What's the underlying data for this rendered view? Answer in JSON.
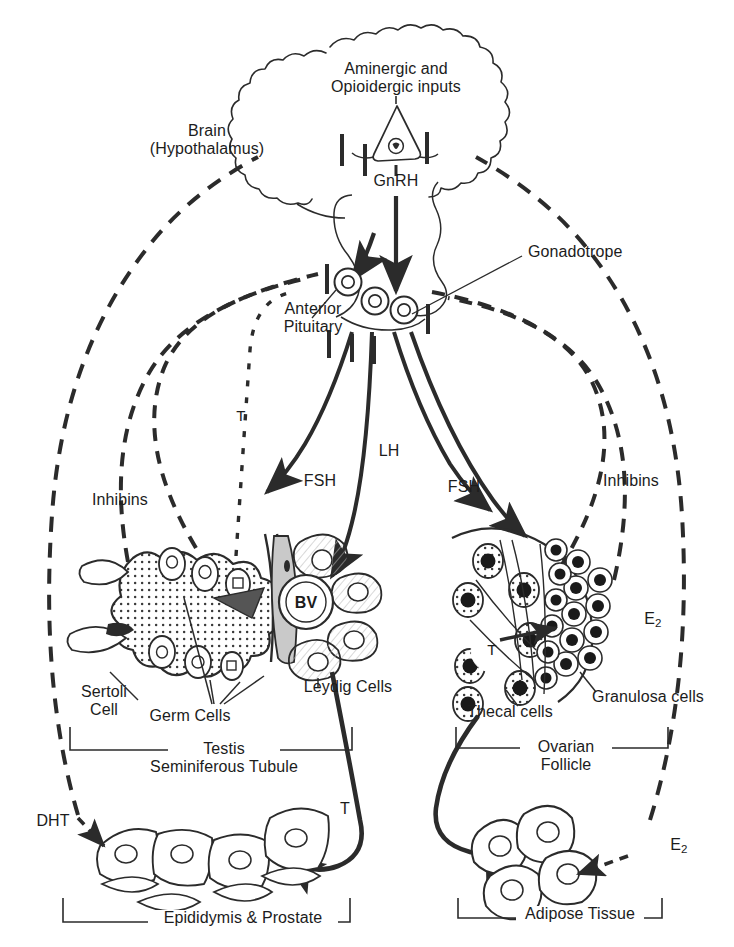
{
  "figure": {
    "type": "biomedical-schematic",
    "width": 734,
    "height": 947,
    "background_color": "#ffffff",
    "line_color": "#2b2b2b"
  },
  "labels": {
    "aminergic_inputs": "Aminergic and\nOpioidergic inputs",
    "brain": "Brain\n(Hypothalamus)",
    "gnrh": "GnRH",
    "gonadotrope": "Gonadotrope",
    "anterior_pituitary": "Anterior\nPituitary",
    "testosterone_dotted": "T",
    "inhibins_left": "Inhibins",
    "inhibins_right": "Inhibins",
    "fsh_left": "FSH",
    "lh": "LH",
    "fsh_right": "FSH",
    "blood_vessel": "BV",
    "sertoli_cell": "Sertoli\nCell",
    "germ_cells": "Germ Cells",
    "leydig_cells": "Leydig Cells",
    "testis_bracket": "Testis\nSeminiferous Tubule",
    "thecal_cells": "Thecal cells",
    "granulosa_cells": "Granulosa cells",
    "ovary_testosterone": "T",
    "ovarian_follicle_bracket": "Ovarian\nFollicle",
    "estradiol_follicle": "E",
    "estradiol_follicle_sub": "2",
    "estradiol_adipose": "E",
    "estradiol_adipose_sub": "2",
    "dht": "DHT",
    "testosterone_target": "T",
    "epididymis_prostate_bracket": "Epididymis & Prostate",
    "adipose_bracket": "Adipose Tissue"
  },
  "legend_semantics": {
    "solid_arrow": "stimulatory hormone flow",
    "dashed_line_with_bar": "negative feedback inhibition",
    "dotted_line": "testosterone feedback to pituitary"
  },
  "pathways": [
    {
      "name": "gnrh-to-pituitary",
      "from": "GnRH neuron",
      "to": "Anterior Pituitary",
      "style": "solid-arrow"
    },
    {
      "name": "fsh-to-testis",
      "from": "Anterior Pituitary",
      "to": "Testis Seminiferous Tubule",
      "style": "solid-arrow"
    },
    {
      "name": "lh-to-leydig",
      "from": "Anterior Pituitary",
      "to": "Leydig Cells",
      "style": "solid-arrow"
    },
    {
      "name": "fsh-to-ovary",
      "from": "Anterior Pituitary",
      "to": "Ovarian Follicle",
      "style": "solid-arrow"
    },
    {
      "name": "lh-to-theca",
      "from": "Anterior Pituitary",
      "to": "Thecal cells",
      "style": "solid-arrow"
    },
    {
      "name": "t-to-epididymis",
      "from": "Leydig Cells",
      "to": "Epididymis & Prostate",
      "style": "solid-arrow"
    },
    {
      "name": "e2-to-adipose",
      "from": "Ovarian Follicle",
      "to": "Adipose Tissue",
      "style": "solid-arrow"
    },
    {
      "name": "inhibins-feedback-left",
      "from": "Sertoli Cell",
      "to": "Anterior Pituitary",
      "style": "dashed-bar"
    },
    {
      "name": "inhibins-feedback-right",
      "from": "Granulosa cells",
      "to": "Anterior Pituitary",
      "style": "dashed-bar"
    },
    {
      "name": "dht-feedback",
      "from": "Epididymis & Prostate",
      "to": "Hypothalamus",
      "style": "dashed-bar"
    },
    {
      "name": "e2-feedback",
      "from": "Adipose Tissue",
      "to": "Hypothalamus",
      "style": "dashed-bar"
    },
    {
      "name": "t-feedback",
      "from": "Testis",
      "to": "Anterior Pituitary",
      "style": "dotted"
    }
  ]
}
